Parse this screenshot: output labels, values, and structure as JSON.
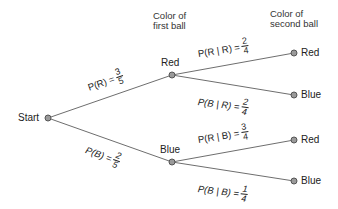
{
  "headers": {
    "first": [
      "Color of",
      "first ball"
    ],
    "second": [
      "Color of",
      "second ball"
    ]
  },
  "nodes": {
    "start": "Start",
    "first_red": "Red",
    "first_blue": "Blue",
    "rr": "Red",
    "rb": "Blue",
    "br": "Red",
    "bb": "Blue"
  },
  "branches": {
    "pR": {
      "lhs": "P(R) =",
      "num": "3",
      "den": "5"
    },
    "pB": {
      "lhs": "P(B) =",
      "num": "2",
      "den": "5"
    },
    "pRgR": {
      "lhs": "P(R | R) =",
      "num": "2",
      "den": "4"
    },
    "pBgR": {
      "lhs": "P(B | R) =",
      "num": "2",
      "den": "4"
    },
    "pRgB": {
      "lhs": "P(R | B) =",
      "num": "3",
      "den": "4"
    },
    "pBgB": {
      "lhs": "P(B | B) =",
      "num": "1",
      "den": "4"
    }
  },
  "colors": {
    "line": "#6e6e6e",
    "node_fill": "#9a9a9a",
    "node_stroke": "#555555",
    "text": "#222222"
  }
}
